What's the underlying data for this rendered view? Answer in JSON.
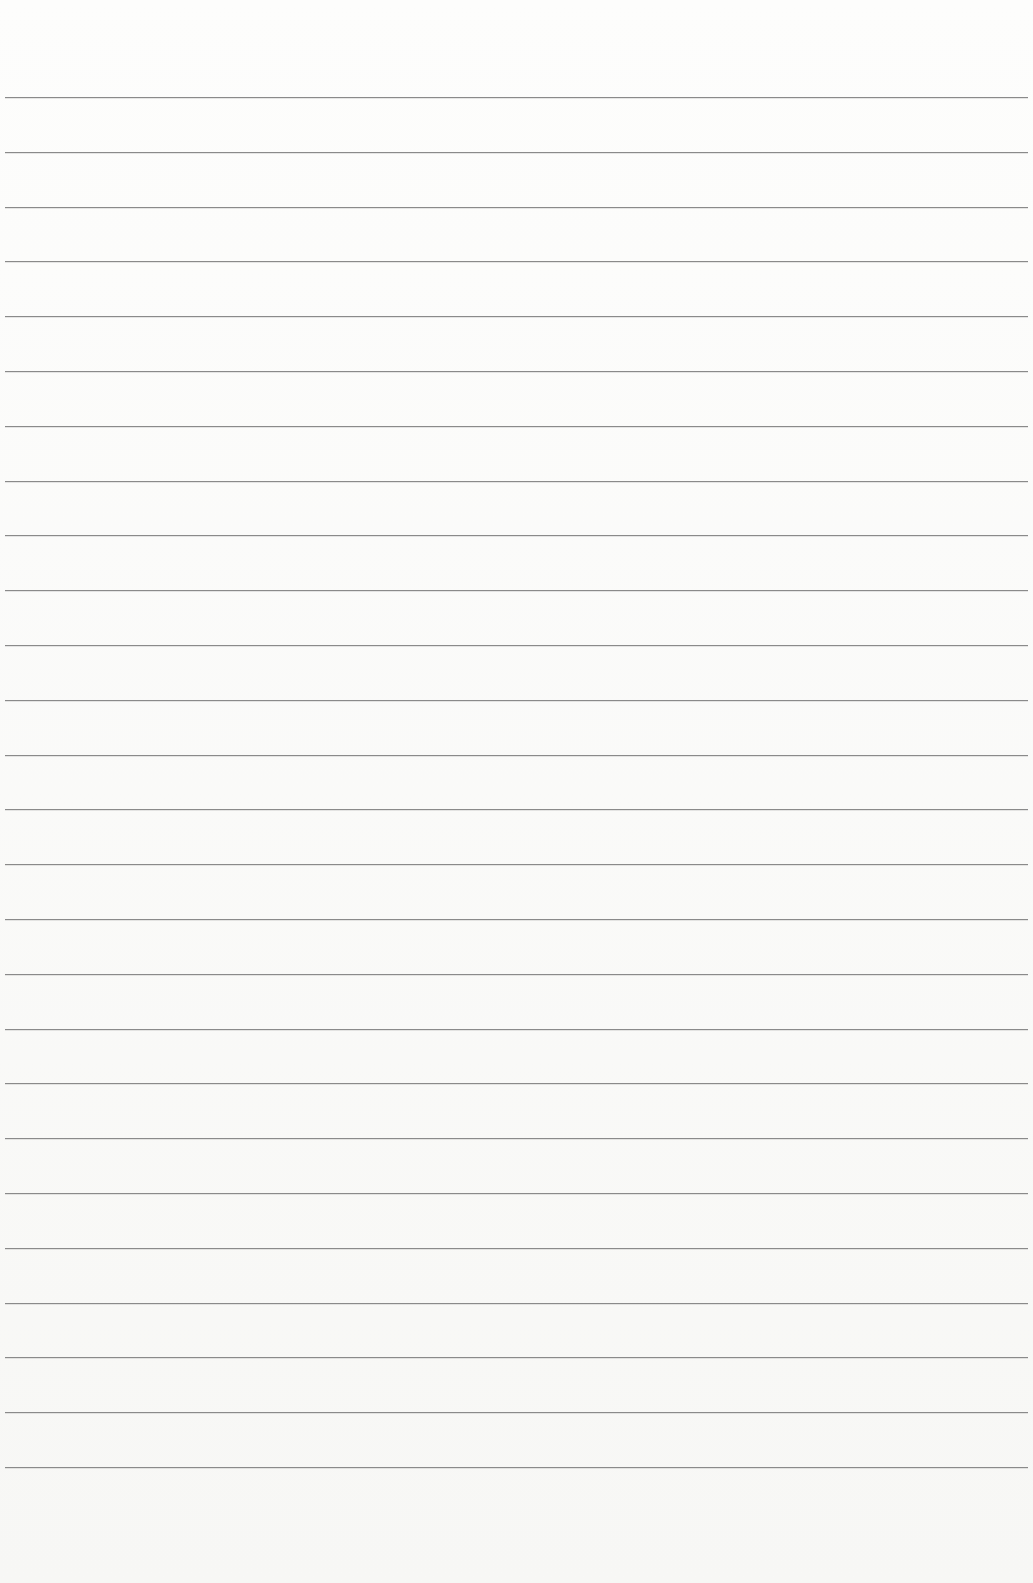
{
  "page": {
    "type": "blank-ruled-paper",
    "line_color": "#8a8a8a",
    "background_color": "#fbfbfa",
    "line_count": 26,
    "first_line_y": 97,
    "line_spacing": 54.8
  }
}
